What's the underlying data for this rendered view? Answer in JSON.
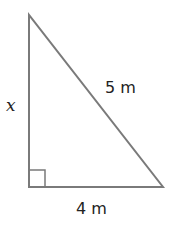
{
  "diagram": {
    "type": "right-triangle",
    "stroke_color": "#7a7a7a",
    "labels": {
      "vertical_side": "x",
      "hypotenuse": "5 m",
      "base": "4 m"
    },
    "right_angle_marker": true
  }
}
